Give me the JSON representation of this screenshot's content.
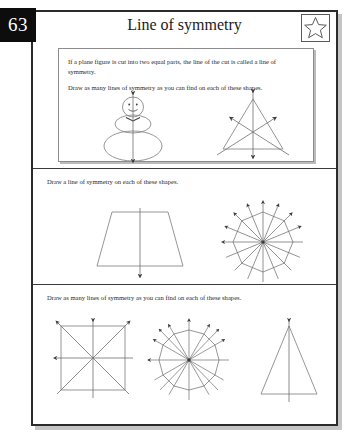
{
  "page": {
    "number": "63",
    "title": "Line of symmetry",
    "star_icon": "star-icon"
  },
  "colors": {
    "page_tab_bg": "#0d0d0d",
    "page_tab_text": "#ffffff",
    "sheet_border": "#2b2b2b",
    "divider": "#3a3a3a",
    "figure_stroke": "#8a8a8a",
    "symmetry_line": "#6f6f6f",
    "text": "#2a2a2a"
  },
  "sections": [
    {
      "id": "intro",
      "definition": "If a plane figure is cut into two equal parts, the line of the cut is called a line of symmetry.",
      "task": "Draw as many lines of symmetry as you can find on each of these shapes.",
      "figures": [
        {
          "name": "snowman",
          "lines_of_symmetry": 1
        },
        {
          "name": "equilateral-triangle",
          "lines_of_symmetry": 3
        }
      ]
    },
    {
      "id": "section-two",
      "instruction": "Draw a line of symmetry on each of these shapes.",
      "figures": [
        {
          "name": "trapezoid",
          "lines_of_symmetry": 1
        },
        {
          "name": "regular-octagon",
          "lines_of_symmetry": 8
        }
      ]
    },
    {
      "id": "section-three",
      "instruction": "Draw as many lines of symmetry as you can find on each of these shapes.",
      "figures": [
        {
          "name": "square",
          "lines_of_symmetry": 4
        },
        {
          "name": "regular-dodecagon",
          "lines_of_symmetry": 12
        },
        {
          "name": "isosceles-triangle",
          "lines_of_symmetry": 1
        }
      ]
    }
  ]
}
